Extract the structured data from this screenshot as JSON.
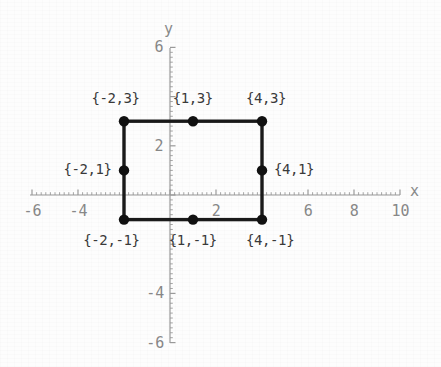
{
  "chart_data": {
    "type": "scatter",
    "title": "",
    "xlabel": "x",
    "ylabel": "y",
    "xlim": [
      -6.6,
      10.4
    ],
    "ylim": [
      -6.2,
      6.2
    ],
    "grid": false,
    "legend": "none",
    "x_ticks": [
      {
        "value": -6,
        "label": "-6"
      },
      {
        "value": -4,
        "label": "-4"
      },
      {
        "value": 2,
        "label": "2"
      },
      {
        "value": 6,
        "label": "6"
      },
      {
        "value": 8,
        "label": "8"
      },
      {
        "value": 10,
        "label": "10"
      }
    ],
    "y_ticks": [
      {
        "value": 6,
        "label": "6"
      },
      {
        "value": 2,
        "label": "2"
      },
      {
        "value": -4,
        "label": "-4"
      },
      {
        "value": -6,
        "label": "-6"
      }
    ],
    "shapes": [
      {
        "kind": "rectangle",
        "x_min": -2,
        "x_max": 4,
        "y_min": -1,
        "y_max": 3,
        "stroke": "#1a1a1a",
        "stroke_width": 3.4,
        "fill": "none"
      }
    ],
    "points": [
      {
        "x": -2,
        "y": 3,
        "label": "{-2,3}",
        "label_pos": "above-left"
      },
      {
        "x": 1,
        "y": 3,
        "label": "{1,3}",
        "label_pos": "above"
      },
      {
        "x": 4,
        "y": 3,
        "label": "{4,3}",
        "label_pos": "above-right"
      },
      {
        "x": -2,
        "y": 1,
        "label": "{-2,1}",
        "label_pos": "left"
      },
      {
        "x": 4,
        "y": 1,
        "label": "{4,1}",
        "label_pos": "right"
      },
      {
        "x": -2,
        "y": -1,
        "label": "{-2,-1}",
        "label_pos": "below-left"
      },
      {
        "x": 1,
        "y": -1,
        "label": "{1,-1}",
        "label_pos": "below"
      },
      {
        "x": 4,
        "y": -1,
        "label": "{4,-1}",
        "label_pos": "below-right"
      }
    ],
    "point_style": {
      "marker": "filled-circle",
      "radius": 5.2,
      "color": "#111111"
    },
    "axis_color": "#9a9a9a",
    "label_color": "#3a3a3a",
    "tick_color": "#888888",
    "background": "#fdfdfd"
  },
  "geometry": {
    "origin_px": {
      "x": 170,
      "y": 195
    },
    "scale_px_per_unit": {
      "x": 23.0,
      "y": 24.6
    },
    "x_axis_px": {
      "from": 30,
      "to": 400
    },
    "y_axis_px": {
      "from": 48,
      "to": 343
    }
  },
  "axis_names": {
    "x": "x",
    "y": "y"
  }
}
